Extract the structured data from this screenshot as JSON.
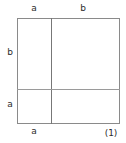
{
  "figure": {
    "caption": "(1)",
    "line_color": "#8a8a8a",
    "text_color": "#2b2b2b",
    "background_color": "#ffffff"
  },
  "labels": {
    "top_left_segment": "a",
    "top_right_segment": "b",
    "left_upper_segment": "b",
    "left_lower_segment": "a",
    "bottom_left_segment": "a"
  },
  "chart_data": {
    "type": "diagram",
    "title": "",
    "caption": "(1)",
    "shape": "square",
    "outer_square": {
      "x": 17,
      "y": 18,
      "width": 103,
      "height": 106
    },
    "partitions": [
      {
        "orientation": "vertical",
        "position": 51
      },
      {
        "orientation": "horizontal",
        "position": 89
      }
    ],
    "edge_labels": [
      {
        "edge": "top",
        "segment": "left",
        "text": "a"
      },
      {
        "edge": "top",
        "segment": "right",
        "text": "b"
      },
      {
        "edge": "left",
        "segment": "upper",
        "text": "b"
      },
      {
        "edge": "left",
        "segment": "lower",
        "text": "a"
      },
      {
        "edge": "bottom",
        "segment": "left",
        "text": "a"
      }
    ],
    "regions": [
      {
        "position": "top-left",
        "width_label": "a",
        "height_label": "b"
      },
      {
        "position": "top-right",
        "width_label": "b",
        "height_label": "b"
      },
      {
        "position": "bottom-left",
        "width_label": "a",
        "height_label": "a"
      },
      {
        "position": "bottom-right",
        "width_label": "b",
        "height_label": "a"
      }
    ]
  }
}
